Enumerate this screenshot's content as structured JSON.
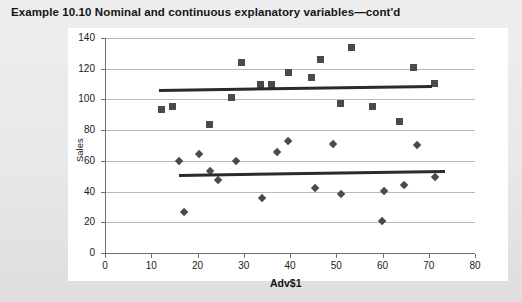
{
  "figure": {
    "title": "Example 10.10  Nominal and continuous explanatory variables—cont'd"
  },
  "chart_data": {
    "type": "scatter",
    "title": "",
    "xlabel": "Adv$1",
    "ylabel": "Sales",
    "xlim": [
      0,
      80
    ],
    "ylim": [
      0,
      140
    ],
    "xticks": [
      0,
      10,
      20,
      30,
      40,
      50,
      60,
      70,
      80
    ],
    "yticks": [
      0,
      20,
      40,
      60,
      80,
      100,
      120,
      140
    ],
    "grid": "horizontal",
    "legend": "none",
    "marker_color": "#4a4a4a",
    "fitline_color": "#2b2b2b",
    "series": [
      {
        "name": "Group 1",
        "marker": "square",
        "points": [
          [
            12.3,
            93.5
          ],
          [
            14.6,
            95.5
          ],
          [
            22.6,
            84.0
          ],
          [
            27.4,
            101.5
          ],
          [
            29.6,
            124.0
          ],
          [
            33.6,
            110.0
          ],
          [
            35.9,
            109.5
          ],
          [
            39.6,
            117.5
          ],
          [
            44.6,
            114.5
          ],
          [
            46.6,
            126.0
          ],
          [
            50.9,
            97.5
          ],
          [
            53.4,
            133.5
          ],
          [
            57.8,
            95.5
          ],
          [
            63.6,
            85.5
          ],
          [
            66.8,
            120.5
          ],
          [
            71.2,
            110.5
          ]
        ]
      },
      {
        "name": "Group 2",
        "marker": "diamond",
        "points": [
          [
            16.1,
            60.0
          ],
          [
            17.0,
            26.8
          ],
          [
            20.4,
            64.5
          ],
          [
            22.7,
            53.5
          ],
          [
            24.4,
            47.5
          ],
          [
            28.3,
            60.0
          ],
          [
            33.9,
            35.5
          ],
          [
            37.3,
            65.5
          ],
          [
            39.5,
            73.0
          ],
          [
            45.4,
            42.0
          ],
          [
            49.3,
            71.0
          ],
          [
            51.1,
            38.5
          ],
          [
            59.9,
            21.0
          ],
          [
            60.3,
            40.0
          ],
          [
            64.6,
            44.5
          ],
          [
            67.4,
            70.0
          ],
          [
            71.4,
            49.5
          ]
        ]
      }
    ],
    "fit_lines": [
      {
        "name": "Group 1 fit",
        "x_start": 11.7,
        "y_start": 106.0,
        "x_end": 70.7,
        "y_end": 108.6
      },
      {
        "name": "Group 2 fit",
        "x_start": 16.0,
        "y_start": 50.3,
        "x_end": 73.5,
        "y_end": 52.9
      }
    ]
  }
}
